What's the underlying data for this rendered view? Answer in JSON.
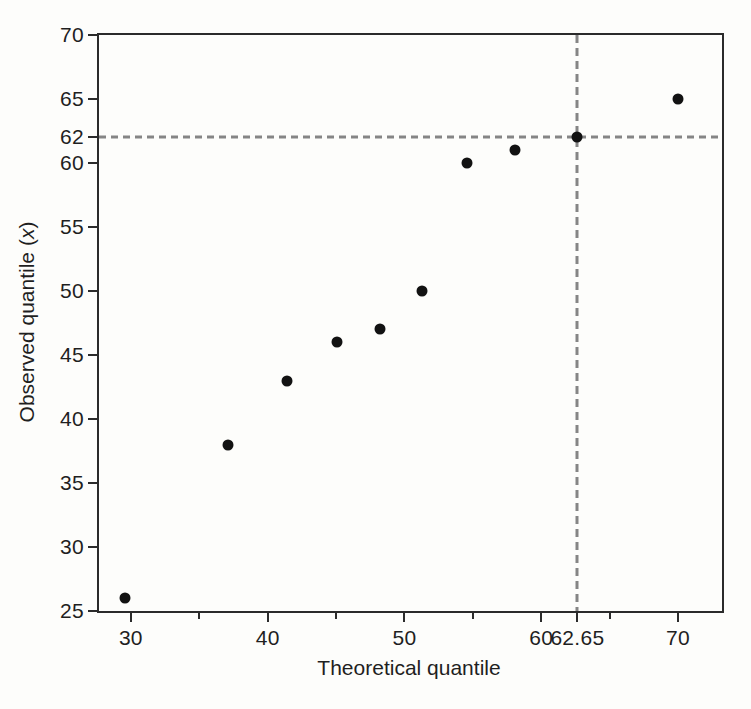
{
  "figure": {
    "background_color": "#fdfdfb",
    "axis_color": "#2b2b2b",
    "text_color": "#1f1f1f",
    "point_color": "#121212",
    "dashed_line_color": "#858585",
    "xlabel": "Theoretical quantile",
    "ylabel_prefix": "Observed quantile (",
    "ylabel_var": "x",
    "ylabel_suffix": ")"
  },
  "chart_data": {
    "type": "scatter",
    "title": "",
    "xlabel": "Theoretical quantile",
    "ylabel": "Observed quantile (x)",
    "xlim": [
      27.67,
      73.22
    ],
    "ylim": [
      25,
      70
    ],
    "grid": false,
    "legend": false,
    "points": [
      {
        "x": 29.6,
        "y": 26
      },
      {
        "x": 37.1,
        "y": 38
      },
      {
        "x": 41.4,
        "y": 43
      },
      {
        "x": 45.1,
        "y": 46
      },
      {
        "x": 48.2,
        "y": 47
      },
      {
        "x": 51.3,
        "y": 50
      },
      {
        "x": 54.6,
        "y": 60
      },
      {
        "x": 58.1,
        "y": 61
      },
      {
        "x": 62.65,
        "y": 62
      },
      {
        "x": 70.0,
        "y": 65
      }
    ],
    "x_major_ticks": [
      {
        "value": 30,
        "label": "30"
      },
      {
        "value": 40,
        "label": "40"
      },
      {
        "value": 50,
        "label": "50"
      },
      {
        "value": 60,
        "label": "60"
      },
      {
        "value": 62.65,
        "label": "62.65"
      },
      {
        "value": 70,
        "label": "70"
      }
    ],
    "x_minor_ticks": [
      35,
      45,
      55,
      65
    ],
    "y_ticks": [
      {
        "value": 25,
        "label": "25"
      },
      {
        "value": 30,
        "label": "30"
      },
      {
        "value": 35,
        "label": "35"
      },
      {
        "value": 40,
        "label": "40"
      },
      {
        "value": 45,
        "label": "45"
      },
      {
        "value": 50,
        "label": "50"
      },
      {
        "value": 55,
        "label": "55"
      },
      {
        "value": 60,
        "label": "60"
      },
      {
        "value": 62,
        "label": "62"
      },
      {
        "value": 65,
        "label": "65"
      },
      {
        "value": 70,
        "label": "70"
      }
    ],
    "reference_lines": {
      "horizontal_y": 62,
      "vertical_x": 62.65
    },
    "highlight_point": {
      "x": 62.65,
      "y": 62
    }
  }
}
